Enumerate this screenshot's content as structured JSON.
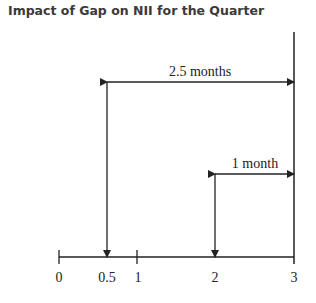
{
  "title": "Impact of Gap on NII for the Quarter",
  "diagram": {
    "type": "timeline",
    "axis": {
      "ticks": [
        "0",
        "0.5",
        "1",
        "2",
        "3"
      ],
      "unit": "months"
    },
    "arrows": [
      {
        "label": "2.5 months",
        "from": 0.5,
        "to": 3
      },
      {
        "label": "1 month",
        "from": 2,
        "to": 3
      }
    ]
  }
}
